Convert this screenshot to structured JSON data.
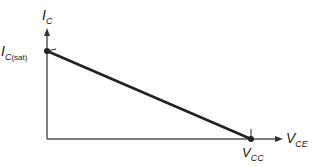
{
  "diagram": {
    "y_axis": {
      "symbol": "I",
      "subscript": "C"
    },
    "x_axis": {
      "symbol": "V",
      "subscript": "CE"
    },
    "point_top": {
      "symbol": "I",
      "subscript": "C",
      "subscript_extra": "(sat)"
    },
    "point_bottom": {
      "symbol": "V",
      "subscript": "CC"
    },
    "colors": {
      "line": "#222222",
      "axis": "#555555"
    }
  }
}
